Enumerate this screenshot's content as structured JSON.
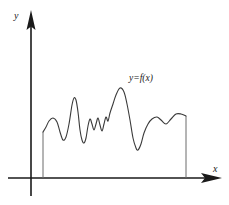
{
  "figure": {
    "kind": "line",
    "background_color": "#ffffff",
    "axes": {
      "y_axis": {
        "label": "y",
        "icon": "arrow-up-icon",
        "x_position": 31,
        "top": 12,
        "bottom": 196,
        "color": "#1a1a1a"
      },
      "x_axis": {
        "label": "x",
        "icon": "arrow-right-icon",
        "y_position": 178,
        "left": 8,
        "right": 221,
        "color": "#1a1a1a"
      }
    },
    "curve": {
      "label": "y=f(x)",
      "color": "#3a3a3a",
      "start_drop_line_x": 43,
      "end_drop_line_x": 186,
      "baseline_y": 178
    }
  },
  "chart_data": {
    "type": "line",
    "title": "",
    "xlabel": "x",
    "ylabel": "y",
    "grid": false,
    "legend": null,
    "annotations": [
      {
        "text": "y=f(x)",
        "x": 130,
        "y": 80
      }
    ],
    "axis_ranges": {
      "x": [
        31,
        221
      ],
      "y": [
        178,
        12
      ]
    },
    "series": [
      {
        "name": "y=f(x)",
        "points": [
          [
            43,
            132
          ],
          [
            46,
            127
          ],
          [
            49,
            121
          ],
          [
            53,
            118
          ],
          [
            57,
            122
          ],
          [
            60,
            132
          ],
          [
            63,
            140
          ],
          [
            66,
            137
          ],
          [
            69,
            124
          ],
          [
            72,
            105
          ],
          [
            74,
            98
          ],
          [
            76,
            100
          ],
          [
            78,
            112
          ],
          [
            80,
            130
          ],
          [
            82,
            140
          ],
          [
            84,
            143
          ],
          [
            86,
            138
          ],
          [
            88,
            126
          ],
          [
            90,
            119
          ],
          [
            92,
            124
          ],
          [
            94,
            130
          ],
          [
            96,
            124
          ],
          [
            98,
            118
          ],
          [
            100,
            125
          ],
          [
            102,
            131
          ],
          [
            104,
            124
          ],
          [
            106,
            117
          ],
          [
            108,
            121
          ],
          [
            110,
            113
          ],
          [
            113,
            104
          ],
          [
            116,
            95
          ],
          [
            120,
            88
          ],
          [
            124,
            92
          ],
          [
            127,
            104
          ],
          [
            130,
            120
          ],
          [
            133,
            138
          ],
          [
            136,
            148
          ],
          [
            138,
            150
          ],
          [
            141,
            144
          ],
          [
            144,
            133
          ],
          [
            148,
            124
          ],
          [
            152,
            119
          ],
          [
            157,
            117
          ],
          [
            161,
            120
          ],
          [
            166,
            124
          ],
          [
            171,
            119
          ],
          [
            176,
            114
          ],
          [
            181,
            114
          ],
          [
            186,
            116
          ]
        ]
      }
    ]
  }
}
